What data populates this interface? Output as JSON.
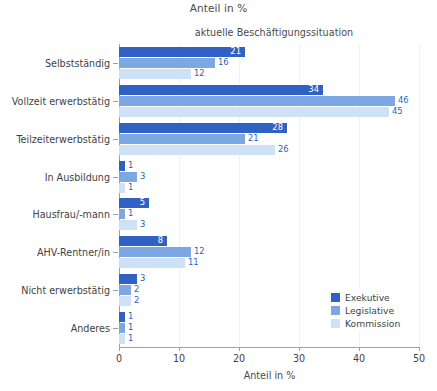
{
  "top_title": "Anteil in %",
  "chart_data": {
    "type": "bar",
    "orientation": "horizontal",
    "title": "aktuelle Beschäftigungssituation",
    "xlabel": "Anteil in %",
    "ylabel": "",
    "xlim": [
      0,
      50
    ],
    "xticks": [
      0,
      10,
      20,
      30,
      40,
      50
    ],
    "xticklabels": [
      "0",
      "10",
      "20",
      "30",
      "40",
      "50"
    ],
    "grid": true,
    "legend_position": "lower right",
    "categories": [
      "Selbstständig",
      "Vollzeit erwerbstätig",
      "Teilzeiterwerbstätig",
      "In Ausbildung",
      "Hausfrau/-mann",
      "AHV-Rentner/in",
      "Nicht erwerbstätig",
      "Anderes"
    ],
    "series": [
      {
        "name": "Exekutive",
        "color": "#2f62c4",
        "values": [
          21,
          34,
          28,
          1,
          5,
          8,
          3,
          1
        ]
      },
      {
        "name": "Legislative",
        "color": "#7ba7e3",
        "values": [
          16,
          46,
          21,
          3,
          1,
          12,
          2,
          1
        ]
      },
      {
        "name": "Kommission",
        "color": "#cfe1f7",
        "values": [
          12,
          45,
          26,
          1,
          3,
          11,
          2,
          1
        ]
      }
    ]
  },
  "legend": {
    "items": [
      {
        "label": "Exekutive",
        "color": "#2f62c4"
      },
      {
        "label": "Legislative",
        "color": "#7ba7e3"
      },
      {
        "label": "Kommission",
        "color": "#cfe1f7"
      }
    ]
  },
  "colors": {
    "axis": "#9aa0ac",
    "grid": "#eef1f7",
    "text": "#3f3f3f",
    "label_outside": "#2b5fc0",
    "label_inside": "#ffffff"
  }
}
